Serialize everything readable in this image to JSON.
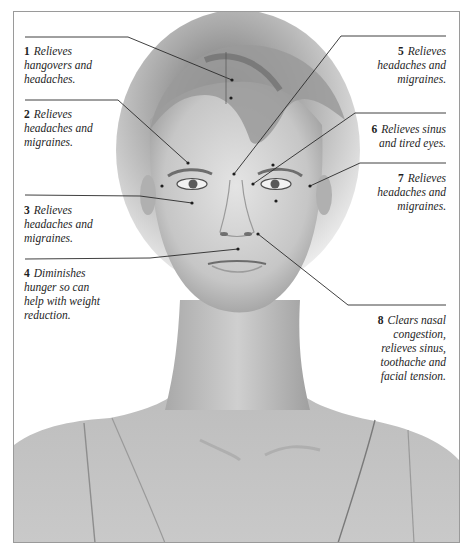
{
  "figure": {
    "frame_color": "#9a9a9a",
    "line_color": "#2a2a2a"
  },
  "points": [
    {
      "num": "1",
      "text": "Relieves hangovers and headaches.",
      "lines": [
        "Relieves",
        "hangovers and",
        "headaches."
      ],
      "side": "left"
    },
    {
      "num": "2",
      "text": "Relieves headaches and migraines.",
      "lines": [
        "Relieves",
        "headaches and",
        "migraines."
      ],
      "side": "left"
    },
    {
      "num": "3",
      "text": "Relieves headaches and migraines.",
      "lines": [
        "Relieves",
        "headaches and",
        "migraines."
      ],
      "side": "left"
    },
    {
      "num": "4",
      "text": "Diminishes hunger so can help with weight reduction.",
      "lines": [
        "Diminishes",
        "hunger so can",
        "help with weight",
        "reduction."
      ],
      "side": "left"
    },
    {
      "num": "5",
      "text": "Relieves headaches and migraines.",
      "lines": [
        "Relieves",
        "headaches and",
        "migraines."
      ],
      "side": "right"
    },
    {
      "num": "6",
      "text": "Relieves sinus and tired eyes.",
      "lines": [
        "Relieves sinus",
        "and tired eyes."
      ],
      "side": "right"
    },
    {
      "num": "7",
      "text": "Relieves headaches and migraines.",
      "lines": [
        "Relieves",
        "headaches and",
        "migraines."
      ],
      "side": "right"
    },
    {
      "num": "8",
      "text": "Clears nasal congestion, relieves sinus, toothache and facial tension.",
      "lines": [
        "Clears nasal",
        "congestion,",
        "relieves sinus,",
        "toothache and",
        "facial tension."
      ],
      "side": "right"
    }
  ]
}
